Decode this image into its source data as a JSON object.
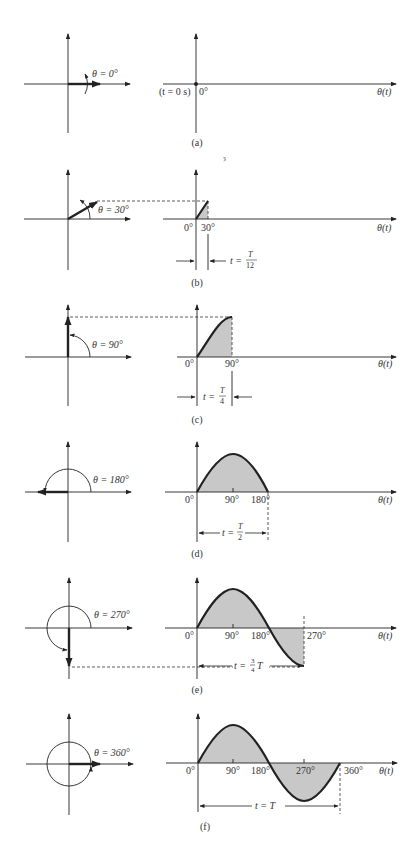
{
  "figure": {
    "panels": [
      {
        "id": "a",
        "caption": "(a)",
        "angle_deg": 0,
        "angle_label": "θ = 0°",
        "time_label": "(t = 0 s)",
        "ticks": [
          "0°"
        ],
        "axis_label": "θ(t)"
      },
      {
        "id": "b",
        "caption": "(b)",
        "angle_deg": 30,
        "angle_label": "θ = 30°",
        "ticks": [
          "0°",
          "30°"
        ],
        "time_label": "t = T/12",
        "time_num": "T",
        "time_den": "12",
        "axis_label": "θ(t)"
      },
      {
        "id": "c",
        "caption": "(c)",
        "angle_deg": 90,
        "angle_label": "θ = 90°",
        "ticks": [
          "0°",
          "90°"
        ],
        "time_label": "t = T/4",
        "time_num": "T",
        "time_den": "4",
        "axis_label": "θ(t)"
      },
      {
        "id": "d",
        "caption": "(d)",
        "angle_deg": 180,
        "angle_label": "θ = 180°",
        "ticks": [
          "0°",
          "90°",
          "180°"
        ],
        "time_label": "t = T/2",
        "time_num": "T",
        "time_den": "2",
        "axis_label": "θ(t)"
      },
      {
        "id": "e",
        "caption": "(e)",
        "angle_deg": 270,
        "angle_label": "θ = 270°",
        "ticks": [
          "0°",
          "90°",
          "180°",
          "270°"
        ],
        "time_label": "t = 3/4 T",
        "time_prefix": "t = ",
        "time_num": "3",
        "time_den": "4",
        "time_suffix": "T",
        "axis_label": "θ(t)"
      },
      {
        "id": "f",
        "caption": "(f)",
        "angle_deg": 360,
        "angle_label": "θ = 360°",
        "ticks": [
          "0°",
          "90°",
          "180°",
          "270°",
          "360°"
        ],
        "time_label": "t = T",
        "axis_label": "θ(t)"
      }
    ],
    "stray_mark": "ȝ"
  },
  "colors": {
    "line": "#222222",
    "shade": "#c8c8c8",
    "text": "#333333"
  }
}
